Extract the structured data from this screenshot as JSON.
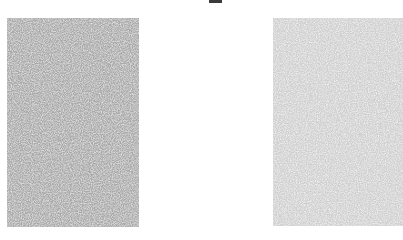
{
  "scene": {
    "background_color": "#ffffff",
    "top_mark": {
      "color": "#3a3a3a"
    },
    "panels": [
      {
        "name": "left-noise-panel",
        "base_color": "#a9a9a9",
        "noise_light": "#d6d6d6",
        "tone": "darker"
      },
      {
        "name": "right-noise-panel",
        "base_color": "#cfcfcf",
        "noise_light": "#ececec",
        "tone": "lighter"
      }
    ]
  }
}
